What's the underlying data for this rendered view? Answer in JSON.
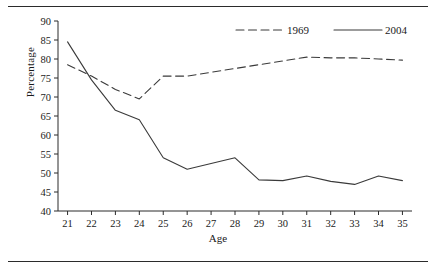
{
  "figure": {
    "rule_top": "horizontal-rule",
    "rule_bottom": "horizontal-rule"
  },
  "chart_data": {
    "type": "line",
    "title": "",
    "xlabel": "Age",
    "ylabel": "Percentage",
    "x": [
      21,
      22,
      23,
      24,
      25,
      26,
      27,
      28,
      29,
      30,
      31,
      32,
      33,
      34,
      35
    ],
    "categories": [
      "21",
      "22",
      "23",
      "24",
      "25",
      "26",
      "27",
      "28",
      "29",
      "30",
      "31",
      "32",
      "33",
      "34",
      "35"
    ],
    "xlim": [
      20.6,
      35.4
    ],
    "ylim": [
      40,
      90
    ],
    "ytick_labels": [
      "40",
      "45",
      "50",
      "55",
      "60",
      "65",
      "70",
      "75",
      "80",
      "85",
      "90"
    ],
    "yticks": [
      40,
      45,
      50,
      55,
      60,
      65,
      70,
      75,
      80,
      85,
      90
    ],
    "grid": false,
    "legend_position": "top-center-right",
    "series": [
      {
        "name": "1969",
        "style": "dashed",
        "color": "#3a3a3a",
        "values": [
          78.5,
          75.5,
          72.0,
          69.5,
          75.5,
          75.5,
          76.5,
          77.5,
          78.5,
          79.5,
          80.5,
          80.3,
          80.3,
          80.0,
          79.7
        ]
      },
      {
        "name": "2004",
        "style": "solid",
        "color": "#3a3a3a",
        "values": [
          84.5,
          74.5,
          66.5,
          64.0,
          54.0,
          51.0,
          52.5,
          54.0,
          48.2,
          48.0,
          49.2,
          47.8,
          47.0,
          49.2,
          48.0
        ]
      }
    ]
  }
}
